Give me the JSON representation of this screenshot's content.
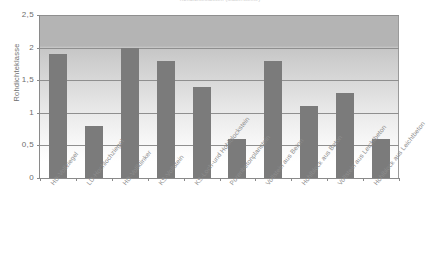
{
  "chart_data": {
    "type": "bar",
    "title": "Rohdichteklassen (Mauersteine)",
    "xlabel": "",
    "ylabel": "Rohdichteklasse",
    "ylim": [
      0,
      2.5
    ],
    "ytick_labels": [
      "0",
      "0,5",
      "1",
      "1,5",
      "2",
      "2,5"
    ],
    "ytick_values": [
      0,
      0.5,
      1,
      1.5,
      2,
      2.5
    ],
    "grid": true,
    "legend": "none",
    "decimal_separator": ",",
    "bar_color": "#7b7b7b",
    "plot_background": "#c8c8c8",
    "categories": [
      "HD-Vollziegel",
      "LD-Hochlochziegel",
      "HD-Vollklinker",
      "KS-Vollstein",
      "KS-Loch-und Hohlblockstein",
      "Porenbetonplanstein",
      "Vollstein aus Beton",
      "Hohlblock aus Beton",
      "Vollstein aus Leichtbeton",
      "Hohlblock aus Leichtbeton"
    ],
    "values": [
      1.9,
      0.8,
      2.0,
      1.8,
      1.4,
      0.6,
      1.8,
      1.1,
      1.3,
      0.6
    ]
  }
}
